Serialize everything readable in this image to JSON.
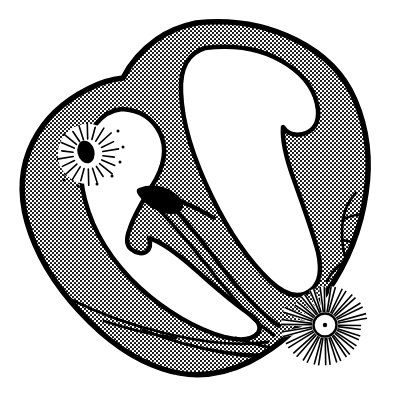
{
  "figure": {
    "title": "Heart cross-section line drawing",
    "caption": "",
    "domain": "Diagram",
    "width": 416,
    "height": 395,
    "background_color": "#ffffff",
    "ink_color": "#000000",
    "style": "black-and-white stippled halftone line art"
  },
  "palette": {
    "background": "#ffffff",
    "outline": "#000000",
    "stipple_dot": "#000000",
    "chamber_fill": "#ffffff",
    "solid_black": "#000000"
  },
  "render": {
    "outline_width_outer": 5.5,
    "outline_width_inner": 4.5,
    "vessel_width": 2.6,
    "ray_width": 1.5,
    "stipple_tile": 4,
    "stipple_dot_radius": 1.05
  },
  "parts": [
    {
      "id": "myocardium-outer-wall",
      "label": "Outer myocardial wall",
      "fill": "stipple"
    },
    {
      "id": "left-chamber",
      "label": "Left chamber cavity",
      "fill": "white"
    },
    {
      "id": "right-chamber",
      "label": "Right chamber cavity",
      "fill": "white"
    },
    {
      "id": "interventricular-septum",
      "label": "Interventricular septum",
      "fill": "stipple"
    },
    {
      "id": "valve-leaflet",
      "label": "Valve leaflet",
      "fill": "black"
    },
    {
      "id": "upper-radiate-body",
      "label": "Upper sunburst body with dark oval core",
      "fill": "white"
    },
    {
      "id": "lower-radiate-body",
      "label": "Lower sunburst body with dot core",
      "fill": "white"
    },
    {
      "id": "coronary-vessels",
      "label": "Branching coronary vessels",
      "fill": "line"
    },
    {
      "id": "apical-trabeculae",
      "label": "Apical trabeculae bands",
      "fill": "line"
    }
  ],
  "geometry": {
    "outer_contour": "M 196 23 C 233 19 268 26 296 40 C 324 54 344 74 355 100 C 367 128 371 160 366 193 C 361 228 348 262 327 292 C 306 322 279 347 249 362 C 220 376 190 378 163 369 C 132 359 104 338 80 312 C 55 285 36 254 27 222 C 19 193 21 166 33 142 C 45 118 66 100 88 89 C 101 82 113 79 123 78 C 130 64 142 50 156 40 C 168 31 182 26 196 23 Z",
    "inner_left_chamber": "M 122 109 C 140 110 153 119 160 133 C 168 149 164 167 152 186 C 142 202 134 216 130 228 C 126 238 126 245 131 249 C 137 254 143 254 146 252 C 150 249 151 244 149 238 C 162 242 178 254 196 270 C 216 288 234 303 248 313 C 258 320 262 327 258 333 C 252 340 240 341 224 337 C 196 329 165 311 140 288 C 112 262 93 231 85 200 C 77 170 81 144 96 124 C 103 115 112 110 122 109 Z",
    "inner_right_chamber": "M 205 48 C 238 44 266 50 288 65 C 306 77 316 92 318 110 C 319 123 314 131 303 134 C 294 136 287 133 283 127 C 282 140 286 158 294 180 C 303 205 312 230 318 252 C 322 270 320 283 311 290 C 300 299 286 296 270 281 C 249 261 229 232 212 197 C 193 158 182 121 181 92 C 180 69 188 53 205 48 Z",
    "septum_band": "M 153 186 C 168 200 190 226 214 258 C 238 290 260 313 277 325",
    "valve_leaflet": "M 140 189 C 150 186 160 187 168 192 C 176 197 180 203 179 208 C 178 213 172 215 164 213 C 154 210 146 203 141 196 C 138 192 138 190 140 189 Z",
    "upper_radiate": {
      "cx": 88,
      "cy": 154,
      "r_body": 30,
      "core_rx": 8,
      "core_ry": 11,
      "rays": 22
    },
    "lower_radiate": {
      "cx": 325,
      "cy": 325,
      "r_body": 42,
      "core_r": 11,
      "core_dot_r": 2,
      "rays": 22
    }
  }
}
